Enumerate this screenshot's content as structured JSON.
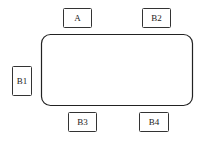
{
  "diagram": {
    "table": {
      "label": ""
    },
    "seats": [
      {
        "id": "A",
        "label": "A",
        "side": "top-left"
      },
      {
        "id": "B2",
        "label": "B2",
        "side": "top-right"
      },
      {
        "id": "B1",
        "label": "B1",
        "side": "left"
      },
      {
        "id": "B3",
        "label": "B3",
        "side": "bottom-left"
      },
      {
        "id": "B4",
        "label": "B4",
        "side": "bottom-right"
      }
    ]
  }
}
